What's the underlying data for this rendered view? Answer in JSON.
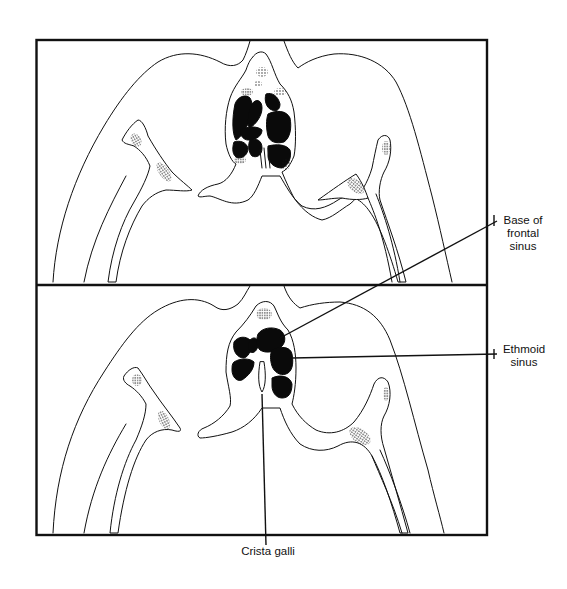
{
  "figure": {
    "panels": [
      {
        "id": "upper",
        "position": "top"
      },
      {
        "id": "lower",
        "position": "bottom"
      }
    ],
    "labels": {
      "base_of_frontal_sinus": {
        "line1": "Base of",
        "line2": "frontal",
        "line3": "sinus"
      },
      "ethmoid_sinus": {
        "line1": "Ethmoid",
        "line2": "sinus"
      },
      "crista_galli": {
        "text": "Crista galli"
      }
    },
    "colors": {
      "ink": "#111111",
      "background": "#ffffff",
      "cavity_fill": "#0a0a0a"
    }
  }
}
